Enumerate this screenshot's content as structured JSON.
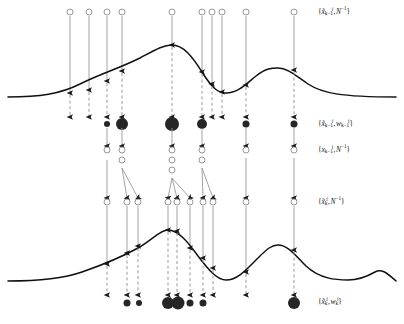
{
  "figure": {
    "colors": {
      "curve": "#111111",
      "open_circle_stroke": "#8c8c8c",
      "solid_arrow": "#999999",
      "dashed_arrow": "#8c8c8c",
      "arrow_head": "#1a1a1a",
      "filled_dot": "#262626",
      "background": "#ffffff"
    }
  },
  "labels": [
    {
      "id": "label-row1",
      "text": "{x̃ₖ₋₁ⁱ, N⁻¹}",
      "base": "x",
      "accent": "tilde",
      "subscript": "k−1",
      "superscript": "i",
      "weight": "N⁻¹",
      "x": 318,
      "y": 12
    },
    {
      "id": "label-row2",
      "text": "{x̃ₖ₋₁ⁱ, wₖ₋₁ⁱ}",
      "base": "x",
      "accent": "tilde",
      "subscript": "k−1",
      "superscript": "i",
      "weight": "wₖ₋₁ⁱ",
      "x": 318,
      "y": 124
    },
    {
      "id": "label-row3",
      "text": "{xₖ₋₁ⁱ, N⁻¹}",
      "base": "x",
      "accent": "none",
      "subscript": "k−1",
      "superscript": "i",
      "weight": "N⁻¹",
      "x": 318,
      "y": 150
    },
    {
      "id": "label-row4",
      "text": "{x̃ₖⁱ, N⁻¹}",
      "base": "x",
      "accent": "tilde",
      "subscript": "k",
      "superscript": "i",
      "weight": "N⁻¹",
      "x": 318,
      "y": 202
    },
    {
      "id": "label-row5",
      "text": "{x̃ₖⁱ, wₖⁱ}",
      "base": "x",
      "accent": "tilde",
      "subscript": "k",
      "superscript": "i",
      "weight": "wₖⁱ",
      "x": 318,
      "y": 302
    }
  ],
  "curves": {
    "upper": {
      "name": "upper-density-curve",
      "path": "M 8 97 C 40 97 60 94 80 84 C 100 74 120 68 140 58 C 155 50 163 45 172 45 C 183 45 192 56 202 72 C 212 88 218 93 226 93 C 238 93 246 84 256 76 C 266 68 272 68 278 68 C 288 68 296 76 308 84 C 322 93 340 97 396 97",
      "baseline_y": 97,
      "peaks": [
        {
          "x": 172,
          "y": 45
        },
        {
          "x": 278,
          "y": 68
        }
      ],
      "valleys": [
        {
          "x": 226,
          "y": 93
        }
      ]
    },
    "lower": {
      "name": "lower-density-curve",
      "path": "M 8 281 C 40 281 62 279 82 272 C 102 265 120 258 138 248 C 152 240 160 230 168 230 C 178 230 188 242 198 256 C 210 272 218 280 226 280 C 238 280 248 268 258 258 C 268 248 272 245 278 245 C 288 245 296 256 306 266 C 320 279 336 280 348 280 C 360 280 368 276 375 272 C 382 268 388 274 396 281",
      "baseline_y": 281,
      "peaks": [
        {
          "x": 168,
          "y": 230
        },
        {
          "x": 278,
          "y": 245
        },
        {
          "x": 375,
          "y": 272
        }
      ],
      "valleys": [
        {
          "x": 226,
          "y": 280
        }
      ]
    }
  },
  "rows": {
    "row1_prior_particles": {
      "name": "row1-open-circles",
      "y": 12,
      "radius": 3,
      "x_positions": [
        70,
        89,
        107,
        122,
        172,
        202,
        212,
        222,
        246,
        294
      ]
    },
    "row1_to_curve_arrows": {
      "name": "row1-solid-down-arrows",
      "from_y": 16,
      "targets": [
        {
          "x": 70,
          "y": 93
        },
        {
          "x": 89,
          "y": 90
        },
        {
          "x": 107,
          "y": 81
        },
        {
          "x": 122,
          "y": 71
        },
        {
          "x": 172,
          "y": 45
        },
        {
          "x": 202,
          "y": 72
        },
        {
          "x": 212,
          "y": 84
        },
        {
          "x": 222,
          "y": 92
        },
        {
          "x": 246,
          "y": 85
        },
        {
          "x": 294,
          "y": 70
        }
      ]
    },
    "row2_dashed_to_weights": {
      "name": "row2-dashed-down-arrows",
      "to_y": 117,
      "x_positions": [
        70,
        89,
        107,
        122,
        172,
        202,
        212,
        222,
        246,
        294
      ]
    },
    "row2_weighted_particles": {
      "name": "row2-filled-dots",
      "y": 124,
      "dots": [
        {
          "x": 107,
          "r": 3.0
        },
        {
          "x": 122,
          "r": 6.0
        },
        {
          "x": 172,
          "r": 7.0
        },
        {
          "x": 202,
          "r": 5.0
        },
        {
          "x": 246,
          "r": 3.5
        },
        {
          "x": 294,
          "r": 3.5
        }
      ]
    },
    "row3_resample_arrows": {
      "name": "row3-resample-arrows",
      "from_y": 128,
      "to_y": 146,
      "x_positions": [
        107,
        122,
        172,
        202,
        246,
        294
      ]
    },
    "row3_resampled_particles": {
      "name": "row3-open-circles",
      "radius": 3,
      "columns": [
        {
          "x": 107,
          "count": 1,
          "ys": [
            150
          ]
        },
        {
          "x": 122,
          "count": 2,
          "ys": [
            150,
            160
          ]
        },
        {
          "x": 172,
          "count": 3,
          "ys": [
            150,
            160,
            170
          ]
        },
        {
          "x": 202,
          "count": 2,
          "ys": [
            150,
            160
          ]
        },
        {
          "x": 246,
          "count": 1,
          "ys": [
            150
          ]
        },
        {
          "x": 294,
          "count": 1,
          "ys": [
            150
          ]
        }
      ]
    },
    "row4_propagation_arrows": {
      "name": "row4-propagation-arrows",
      "to_y": 198,
      "edges": [
        {
          "x1": 107,
          "y1": 160,
          "x2": 107,
          "y2": 198
        },
        {
          "x1": 122,
          "y1": 168,
          "x2": 127,
          "y2": 198
        },
        {
          "x1": 122,
          "y1": 168,
          "x2": 138,
          "y2": 198
        },
        {
          "x1": 172,
          "y1": 178,
          "x2": 168,
          "y2": 198
        },
        {
          "x1": 172,
          "y1": 178,
          "x2": 177,
          "y2": 198
        },
        {
          "x1": 172,
          "y1": 178,
          "x2": 190,
          "y2": 198
        },
        {
          "x1": 202,
          "y1": 168,
          "x2": 203,
          "y2": 198
        },
        {
          "x1": 202,
          "y1": 168,
          "x2": 213,
          "y2": 198
        },
        {
          "x1": 246,
          "y1": 158,
          "x2": 246,
          "y2": 198
        },
        {
          "x1": 294,
          "y1": 158,
          "x2": 294,
          "y2": 198
        }
      ]
    },
    "row4_predicted_particles": {
      "name": "row4-open-circles",
      "y": 202,
      "radius": 3,
      "x_positions": [
        107,
        127,
        138,
        168,
        177,
        190,
        203,
        213,
        246,
        294
      ]
    },
    "row4_to_curve_arrows": {
      "name": "row4-solid-down-arrows",
      "from_y": 206,
      "targets": [
        {
          "x": 107,
          "y": 264
        },
        {
          "x": 127,
          "y": 253
        },
        {
          "x": 138,
          "y": 246
        },
        {
          "x": 168,
          "y": 230
        },
        {
          "x": 177,
          "y": 231
        },
        {
          "x": 190,
          "y": 248
        },
        {
          "x": 203,
          "y": 258
        },
        {
          "x": 213,
          "y": 268
        },
        {
          "x": 246,
          "y": 272
        },
        {
          "x": 294,
          "y": 250
        }
      ]
    },
    "row5_dashed_to_weights": {
      "name": "row5-dashed-down-arrows",
      "to_y": 295,
      "x_positions": [
        107,
        127,
        138,
        168,
        177,
        190,
        203,
        213,
        246,
        294
      ]
    },
    "row5_weighted_particles": {
      "name": "row5-filled-dots",
      "y": 303,
      "dots": [
        {
          "x": 127,
          "r": 3.5
        },
        {
          "x": 139,
          "r": 3.0
        },
        {
          "x": 168,
          "r": 6.0
        },
        {
          "x": 178,
          "r": 6.5
        },
        {
          "x": 190,
          "r": 3.5
        },
        {
          "x": 203,
          "r": 3.5
        },
        {
          "x": 294,
          "r": 6.0
        }
      ]
    }
  }
}
